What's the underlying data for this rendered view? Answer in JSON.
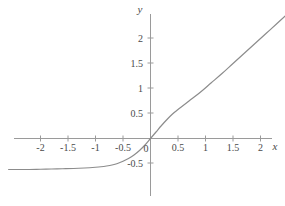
{
  "figure": {
    "background_color": "#ffffff",
    "axis_color": "#9a9a9a",
    "curve_color": "#8c8c8c",
    "text_color": "#4a4a4a"
  },
  "axes": {
    "x_axis_label": "x",
    "y_axis_label": "y",
    "origin_label": "0"
  },
  "chart_data": {
    "type": "line",
    "title": "",
    "xlabel": "x",
    "ylabel": "y",
    "grid": false,
    "legend": null,
    "xlim": [
      -2.58,
      2.45
    ],
    "ylim": [
      -0.75,
      2.4
    ],
    "x_ticks": [
      -2,
      -1.5,
      -1,
      -0.5,
      0,
      0.5,
      1,
      1.5,
      2
    ],
    "x_tick_labels": [
      "-2",
      "-1.5",
      "-1",
      "-0.5",
      "0",
      "0.5",
      "1",
      "1.5",
      "2"
    ],
    "y_ticks": [
      0.5,
      1,
      1.5,
      2
    ],
    "y_tick_labels": [
      "0.5",
      "1",
      "1.5",
      "2"
    ],
    "negative_y_ticks": [
      -0.5
    ],
    "negative_y_tick_labels": [
      "-0.5"
    ],
    "series": [
      {
        "name": "softplus-like curve",
        "x": [
          -2.58,
          -2.4,
          -2.2,
          -2.0,
          -1.8,
          -1.6,
          -1.4,
          -1.2,
          -1.0,
          -0.9,
          -0.8,
          -0.7,
          -0.6,
          -0.5,
          -0.4,
          -0.3,
          -0.2,
          -0.1,
          0.0,
          0.1,
          0.2,
          0.3,
          0.4,
          0.5,
          0.7,
          0.9,
          1.1,
          1.3,
          1.5,
          1.7,
          1.9,
          2.1,
          2.3,
          2.45
        ],
        "y": [
          -0.62,
          -0.62,
          -0.62,
          -0.615,
          -0.61,
          -0.605,
          -0.6,
          -0.59,
          -0.575,
          -0.565,
          -0.55,
          -0.53,
          -0.5,
          -0.455,
          -0.4,
          -0.33,
          -0.24,
          -0.13,
          0.0,
          0.13,
          0.26,
          0.38,
          0.49,
          0.58,
          0.75,
          0.92,
          1.11,
          1.3,
          1.5,
          1.7,
          1.9,
          2.1,
          2.3,
          2.45
        ]
      }
    ]
  }
}
